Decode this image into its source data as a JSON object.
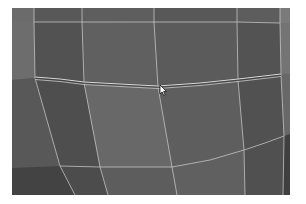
{
  "viewport": {
    "type": "3d-mesh-viewport",
    "background_color": "#ffffff",
    "frame": {
      "x": 12,
      "y": 8,
      "width": 278,
      "height": 187
    },
    "colors": {
      "wire": "#d8d8d8",
      "selected_edge": "#e6e6e6",
      "face_dark": "#4a4a4a",
      "face_mid": "#5a5a5a",
      "face_light": "#6c6c6c",
      "face_edge": "#3c3c3c"
    }
  },
  "mesh": {
    "selected_edge_loop": "horizontal-middle-loop",
    "cursor": {
      "icon": "arrow-pointer-icon",
      "x": 161,
      "y": 86
    }
  }
}
